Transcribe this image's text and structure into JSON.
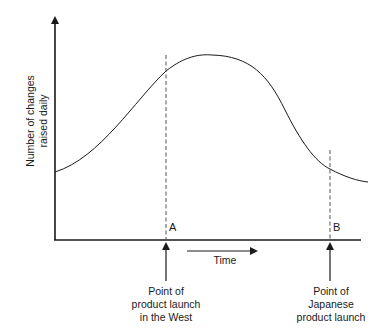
{
  "diagram": {
    "y_axis_label_line1": "Number of changes",
    "y_axis_label_line2": "raised daily",
    "x_axis_label": "Time",
    "point_a": {
      "marker": "A",
      "caption_line1": "Point of",
      "caption_line2": "product launch",
      "caption_line3": "in the West"
    },
    "point_b": {
      "marker": "B",
      "caption_line1": "Point of",
      "caption_line2": "Japanese",
      "caption_line3": "product launch"
    },
    "curve_description": "Changes rise to a peak shortly after Western launch (A) and fall to a low level by Japanese launch (B)"
  }
}
